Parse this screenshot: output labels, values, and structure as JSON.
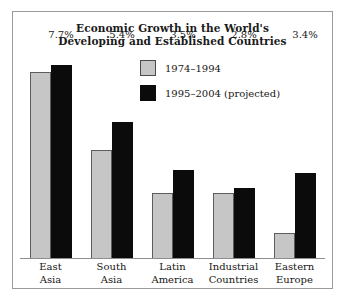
{
  "chart_data": {
    "type": "bar",
    "title": "Economic Growth in the World's Developing and Established Countries",
    "title_line1": "Economic Growth in the World's",
    "title_line2": "Developing and Established Countries",
    "xlabel": "",
    "ylabel": "",
    "ylim": [
      0,
      8.6
    ],
    "grid": false,
    "legend_position": "top-right",
    "categories": [
      "East Asia",
      "South Asia",
      "Latin America",
      "Industrial Countries",
      "Eastern Europe"
    ],
    "category_lines": [
      {
        "l1": "East",
        "l2": "Asia"
      },
      {
        "l1": "South",
        "l2": "Asia"
      },
      {
        "l1": "Latin",
        "l2": "America"
      },
      {
        "l1": "Industrial",
        "l2": "Countries"
      },
      {
        "l1": "Eastern",
        "l2": "Europe"
      }
    ],
    "series": [
      {
        "name": "1974–1994",
        "color": "#c6c6c6",
        "values": [
          7.4,
          4.3,
          2.6,
          2.6,
          1.0
        ],
        "labels": [
          "",
          "",
          "",
          "",
          ""
        ]
      },
      {
        "name": "1995–2004 (projected)",
        "color": "#0b0b0b",
        "values": [
          7.7,
          5.4,
          3.5,
          2.8,
          3.4
        ],
        "labels": [
          "7.7%",
          "5.4%",
          "3.5%",
          "2.8%",
          "3.4%"
        ]
      }
    ],
    "annotations": [
      "7.7%",
      "5.4%",
      "3.5%",
      "2.8%",
      "3.4%"
    ]
  },
  "legend": {
    "items": [
      {
        "label": "1974–1994",
        "swatch": "gray"
      },
      {
        "label": "1995–2004 (projected)",
        "swatch": "black"
      }
    ]
  },
  "colors": {
    "frame_border": "#9a9a9a",
    "axis": "#8d8d8d",
    "series_old": "#c6c6c6",
    "series_new": "#0b0b0b",
    "text": "#161616",
    "background": "#ffffff"
  }
}
